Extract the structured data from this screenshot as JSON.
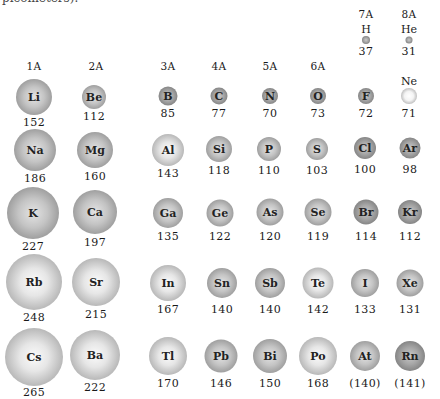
{
  "caption_fragment": "picometers).",
  "unit": "pm",
  "groups": [
    {
      "label": "1A",
      "x": 34
    },
    {
      "label": "2A",
      "x": 96
    },
    {
      "label": "3A",
      "x": 168
    },
    {
      "label": "4A",
      "x": 219
    },
    {
      "label": "5A",
      "x": 270
    },
    {
      "label": "6A",
      "x": 318
    },
    {
      "label": "7A",
      "x": 366
    },
    {
      "label": "8A",
      "x": 409
    }
  ],
  "elements": [
    {
      "symbol": "H",
      "radius": "37",
      "group": "7A",
      "period": 1
    },
    {
      "symbol": "He",
      "radius": "31",
      "group": "8A",
      "period": 1
    },
    {
      "symbol": "Li",
      "radius": "152",
      "group": "1A",
      "period": 2
    },
    {
      "symbol": "Be",
      "radius": "112",
      "group": "2A",
      "period": 2
    },
    {
      "symbol": "B",
      "radius": "85",
      "group": "3A",
      "period": 2
    },
    {
      "symbol": "C",
      "radius": "77",
      "group": "4A",
      "period": 2
    },
    {
      "symbol": "N",
      "radius": "70",
      "group": "5A",
      "period": 2
    },
    {
      "symbol": "O",
      "radius": "73",
      "group": "6A",
      "period": 2
    },
    {
      "symbol": "F",
      "radius": "72",
      "group": "7A",
      "period": 2
    },
    {
      "symbol": "Ne",
      "radius": "71",
      "group": "8A",
      "period": 2
    },
    {
      "symbol": "Na",
      "radius": "186",
      "group": "1A",
      "period": 3
    },
    {
      "symbol": "Mg",
      "radius": "160",
      "group": "2A",
      "period": 3
    },
    {
      "symbol": "Al",
      "radius": "143",
      "group": "3A",
      "period": 3
    },
    {
      "symbol": "Si",
      "radius": "118",
      "group": "4A",
      "period": 3
    },
    {
      "symbol": "P",
      "radius": "110",
      "group": "5A",
      "period": 3
    },
    {
      "symbol": "S",
      "radius": "103",
      "group": "6A",
      "period": 3
    },
    {
      "symbol": "Cl",
      "radius": "100",
      "group": "7A",
      "period": 3
    },
    {
      "symbol": "Ar",
      "radius": "98",
      "group": "8A",
      "period": 3
    },
    {
      "symbol": "K",
      "radius": "227",
      "group": "1A",
      "period": 4
    },
    {
      "symbol": "Ca",
      "radius": "197",
      "group": "2A",
      "period": 4
    },
    {
      "symbol": "Ga",
      "radius": "135",
      "group": "3A",
      "period": 4
    },
    {
      "symbol": "Ge",
      "radius": "122",
      "group": "4A",
      "period": 4
    },
    {
      "symbol": "As",
      "radius": "120",
      "group": "5A",
      "period": 4
    },
    {
      "symbol": "Se",
      "radius": "119",
      "group": "6A",
      "period": 4
    },
    {
      "symbol": "Br",
      "radius": "114",
      "group": "7A",
      "period": 4
    },
    {
      "symbol": "Kr",
      "radius": "112",
      "group": "8A",
      "period": 4
    },
    {
      "symbol": "Rb",
      "radius": "248",
      "group": "1A",
      "period": 5
    },
    {
      "symbol": "Sr",
      "radius": "215",
      "group": "2A",
      "period": 5
    },
    {
      "symbol": "In",
      "radius": "167",
      "group": "3A",
      "period": 5
    },
    {
      "symbol": "Sn",
      "radius": "140",
      "group": "4A",
      "period": 5
    },
    {
      "symbol": "Sb",
      "radius": "140",
      "group": "5A",
      "period": 5
    },
    {
      "symbol": "Te",
      "radius": "142",
      "group": "6A",
      "period": 5
    },
    {
      "symbol": "I",
      "radius": "133",
      "group": "7A",
      "period": 5
    },
    {
      "symbol": "Xe",
      "radius": "131",
      "group": "8A",
      "period": 5
    },
    {
      "symbol": "Cs",
      "radius": "265",
      "group": "1A",
      "period": 6
    },
    {
      "symbol": "Ba",
      "radius": "222",
      "group": "2A",
      "period": 6
    },
    {
      "symbol": "Tl",
      "radius": "170",
      "group": "3A",
      "period": 6
    },
    {
      "symbol": "Pb",
      "radius": "146",
      "group": "4A",
      "period": 6
    },
    {
      "symbol": "Bi",
      "radius": "150",
      "group": "5A",
      "period": 6
    },
    {
      "symbol": "Po",
      "radius": "168",
      "group": "6A",
      "period": 6
    },
    {
      "symbol": "At",
      "radius": "(140)",
      "group": "7A",
      "period": 6
    },
    {
      "symbol": "Rn",
      "radius": "(141)",
      "group": "8A",
      "period": 6
    }
  ]
}
